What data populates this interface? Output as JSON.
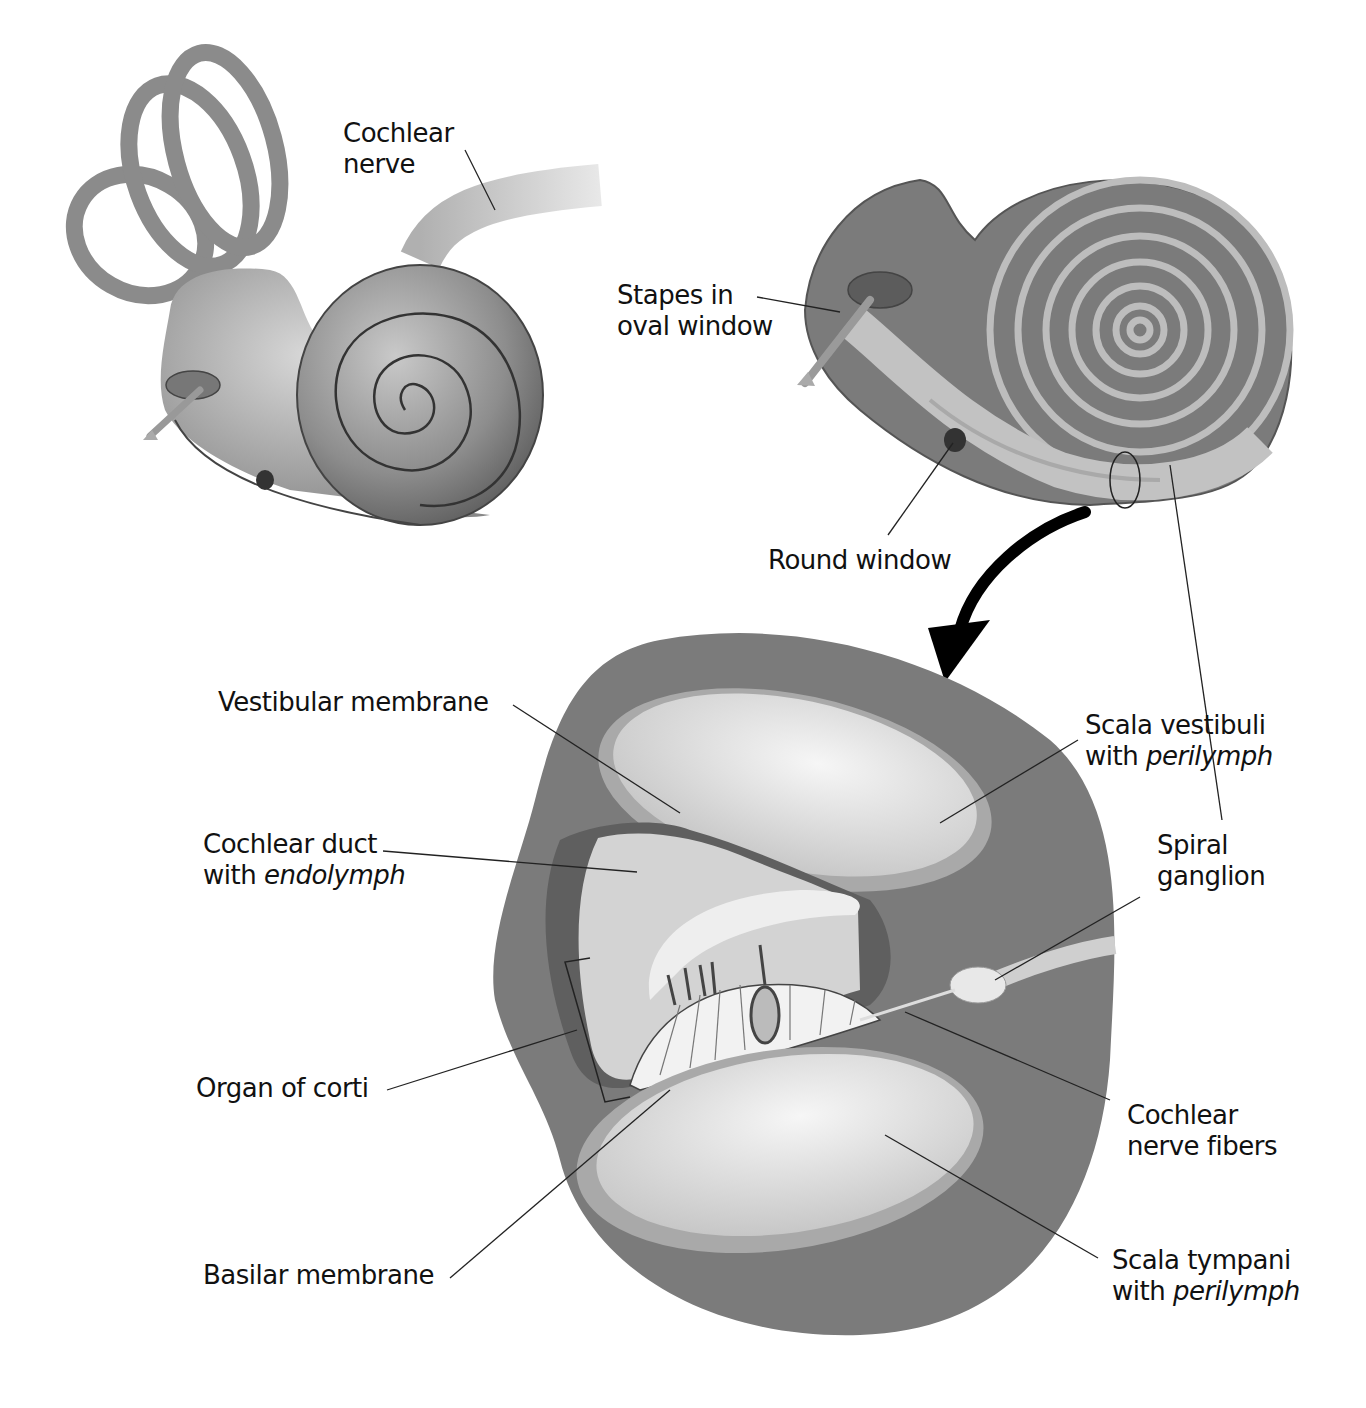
{
  "figure": {
    "title": "",
    "panels": [
      {
        "id": "inner-ear-external",
        "description": "Inner ear with semicircular canals and cochlea"
      },
      {
        "id": "cochlea-section",
        "description": "Cochlea cut open showing spiral canals"
      },
      {
        "id": "cochlea-cross-section",
        "description": "Cross section of cochlear turn"
      }
    ]
  },
  "labels": {
    "cochlear_nerve": {
      "line1": "Cochlear",
      "line2": "nerve"
    },
    "stapes": {
      "line1": "Stapes in",
      "line2": "oval window"
    },
    "round_window": {
      "line1": "Round window"
    },
    "vestibular_membrane": {
      "line1": "Vestibular membrane"
    },
    "scala_vestibuli": {
      "line1": "Scala vestibuli",
      "line2_prefix": "with ",
      "line2_italic": "perilymph"
    },
    "cochlear_duct": {
      "line1": "Cochlear duct",
      "line2_prefix": "with ",
      "line2_italic": "endolymph"
    },
    "spiral_ganglion": {
      "line1": "Spiral",
      "line2": "ganglion"
    },
    "organ_of_corti": {
      "line1": "Organ of corti"
    },
    "cochlear_nerve_fibers": {
      "line1": "Cochlear",
      "line2": "nerve fibers"
    },
    "basilar_membrane": {
      "line1": "Basilar membrane"
    },
    "scala_tympani": {
      "line1": "Scala tympani",
      "line2_prefix": "with ",
      "line2_italic": "perilymph"
    }
  },
  "colors": {
    "dark_gray": "#6e6e6e",
    "mid_gray": "#8a8a8a",
    "light_gray": "#bdbdbd",
    "pale": "#e6e6e6",
    "arrow": "#000000"
  }
}
